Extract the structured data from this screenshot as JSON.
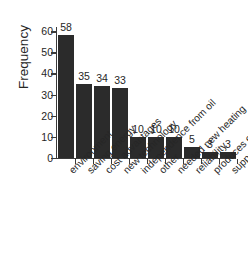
{
  "chart_data": {
    "type": "bar",
    "title": "",
    "subtitle": "",
    "xlabel": "",
    "ylabel": "Frequency",
    "ylim": [
      0,
      62
    ],
    "yticks": [
      0,
      10,
      20,
      30,
      40,
      50,
      60
    ],
    "ytick_labels": [
      "0",
      "10",
      "20",
      "30",
      "40",
      "50",
      "60"
    ],
    "grid": false,
    "legend": false,
    "legend_position": "none",
    "bar_color": "#2b2b2b",
    "background_color": "#ffffff",
    "axis_color": "#3a3a3a",
    "text_color": "#262626",
    "xtick_label_rotation": -45,
    "data_labels_shown": true,
    "categories": [
      "environment",
      "saving energy",
      "cost advantages",
      "new technology",
      "independence from oil",
      "other",
      "needed new heating",
      "reliability",
      "produces electricity",
      "support schemes"
    ],
    "values": [
      58,
      35,
      34,
      33,
      10,
      10,
      10,
      5,
      3,
      3
    ],
    "value_labels": [
      "58",
      "35",
      "34",
      "33",
      "10",
      "10",
      "10",
      "5",
      "3",
      "3"
    ]
  }
}
